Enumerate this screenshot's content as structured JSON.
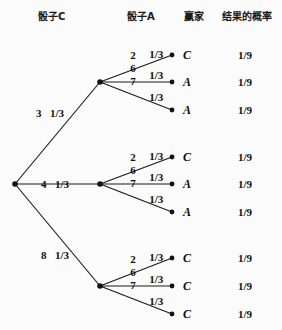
{
  "headers": [
    {
      "label": "骰子C",
      "x": 38,
      "y": 12
    },
    {
      "label": "骰子A",
      "x": 127,
      "y": 12
    },
    {
      "label": "赢家",
      "x": 184,
      "y": 12
    },
    {
      "label": "结果的概率",
      "x": 222,
      "y": 12
    }
  ],
  "chart_data": {
    "type": "diagram",
    "diagram_type": "probability-tree",
    "title": "",
    "columns": [
      "骰子C",
      "骰子A",
      "赢家",
      "结果的概率"
    ],
    "root": {
      "x": 15,
      "y": 184
    },
    "branches": [
      {
        "die_c_value": "3",
        "die_c_prob": "1/3",
        "node": {
          "x": 100,
          "y": 82
        },
        "label_pos": {
          "x": 36,
          "y": 108
        },
        "leaves": [
          {
            "die_a_value": "2",
            "die_a_prob": "1/3",
            "winner": "C",
            "result_prob": "1/9",
            "y": 55
          },
          {
            "die_a_value": "6",
            "die_a_prob": "1/3",
            "winner": "A",
            "result_prob": "1/9",
            "y": 82
          },
          {
            "die_a_value": "7",
            "die_a_prob": "1/3",
            "winner": "A",
            "result_prob": "1/9",
            "y": 110
          }
        ]
      },
      {
        "die_c_value": "4",
        "die_c_prob": "1/3",
        "node": {
          "x": 100,
          "y": 184
        },
        "label_pos": {
          "x": 41,
          "y": 179
        },
        "leaves": [
          {
            "die_a_value": "2",
            "die_a_prob": "1/3",
            "winner": "C",
            "result_prob": "1/9",
            "y": 157
          },
          {
            "die_a_value": "6",
            "die_a_prob": "1/3",
            "winner": "A",
            "result_prob": "1/9",
            "y": 184
          },
          {
            "die_a_value": "7",
            "die_a_prob": "1/3",
            "winner": "A",
            "result_prob": "1/9",
            "y": 212
          }
        ]
      },
      {
        "die_c_value": "8",
        "die_c_prob": "1/3",
        "node": {
          "x": 100,
          "y": 286
        },
        "label_pos": {
          "x": 41,
          "y": 250
        },
        "leaves": [
          {
            "die_a_value": "2",
            "die_a_prob": "1/3",
            "winner": "C",
            "result_prob": "1/9",
            "y": 258
          },
          {
            "die_a_value": "6",
            "die_a_prob": "1/3",
            "winner": "C",
            "result_prob": "1/9",
            "y": 286
          },
          {
            "die_a_value": "7",
            "die_a_prob": "1/3",
            "winner": "C",
            "result_prob": "1/9",
            "y": 314
          }
        ]
      }
    ],
    "leaf_node_x": 172,
    "winner_label_x": 183,
    "result_prob_x": 238,
    "line_color": "#1a1a1a",
    "node_color": "#111111",
    "background": "#fbfbfb"
  }
}
